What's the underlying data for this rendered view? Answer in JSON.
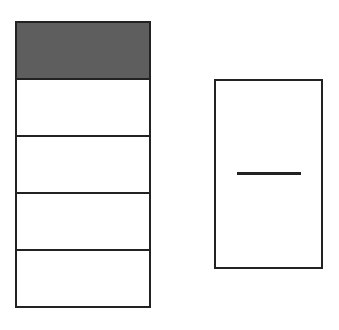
{
  "diagram": {
    "left_bar": {
      "segments": [
        {
          "index": 0,
          "shaded": true
        },
        {
          "index": 1,
          "shaded": false
        },
        {
          "index": 2,
          "shaded": false
        },
        {
          "index": 3,
          "shaded": false
        },
        {
          "index": 4,
          "shaded": false
        }
      ],
      "total_segments": 5,
      "shaded_segments": 1,
      "shade_color": "#5e5e5e"
    },
    "right_box": {
      "content": "horizontal-line"
    },
    "stroke_color": "#222222"
  }
}
